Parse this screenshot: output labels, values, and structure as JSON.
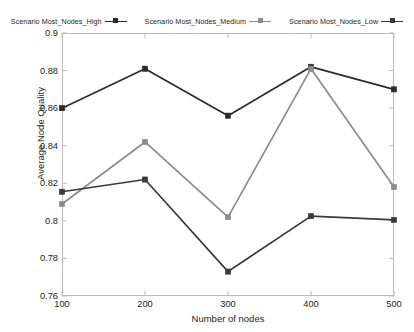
{
  "chart_data": {
    "type": "line",
    "title": "",
    "xlabel": "Number of nodes",
    "ylabel": "Average Node Quality",
    "categories": [
      100,
      200,
      300,
      400,
      500
    ],
    "x": [
      100,
      200,
      300,
      400,
      500
    ],
    "xlim": [
      100,
      500
    ],
    "ylim": [
      0.76,
      0.9
    ],
    "yticks": [
      "0.76",
      "0.78",
      "0.8",
      "0.82",
      "0.84",
      "0.86",
      "0.88",
      "0.9"
    ],
    "ytick_values": [
      0.76,
      0.78,
      0.8,
      0.82,
      0.84,
      0.86,
      0.88,
      0.9
    ],
    "xticks": [
      "100",
      "200",
      "300",
      "400",
      "500"
    ],
    "grid": false,
    "legend_position": "top-center",
    "marker": "square",
    "series": [
      {
        "name": "Scenario Most_Nodes_High",
        "color": "#2b2b2b",
        "values": [
          0.86,
          0.881,
          0.856,
          0.882,
          0.87
        ]
      },
      {
        "name": "Scenario Most_Nodes_Medium",
        "color": "#8c8c8c",
        "values": [
          0.809,
          0.842,
          0.802,
          0.881,
          0.818
        ]
      },
      {
        "name": "Scenario Most_Nodes_Low",
        "color": "#3a3a3a",
        "values": [
          0.8155,
          0.822,
          0.773,
          0.8025,
          0.8005
        ]
      }
    ]
  },
  "axes": {
    "frame_color": "#b9bcc4"
  }
}
